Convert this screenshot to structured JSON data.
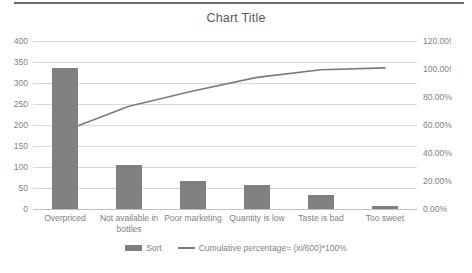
{
  "chart_data": {
    "type": "bar",
    "title": "Chart Title",
    "categories": [
      "Overpriced",
      "Not available in bottles",
      "Poor marketing",
      "Quantity is low",
      "Taste is bad",
      "Too sweet"
    ],
    "series": [
      {
        "name": "Sort",
        "type": "bar",
        "axis": "left",
        "values": [
          335,
          105,
          66,
          58,
          33,
          8
        ]
      },
      {
        "name": "Cumulative percentage= (xi/600)*100%",
        "type": "line",
        "axis": "right",
        "values": [
          55.83,
          73.33,
          84.33,
          94.0,
          99.5,
          100.83
        ]
      }
    ],
    "xlabel": "",
    "ylabel": "",
    "ylim": [
      0,
      400
    ],
    "y_ticks": [
      0,
      50,
      100,
      150,
      200,
      250,
      300,
      350,
      400
    ],
    "y2lim": [
      0,
      120
    ],
    "y2_ticks": [
      0,
      20,
      40,
      60,
      80,
      100,
      120
    ],
    "y2_tick_labels": [
      "0.00%",
      "20.00%",
      "40.00%",
      "60.00%",
      "80.00%",
      "100.00!",
      "120.00!"
    ],
    "grid": true,
    "legend_position": "bottom",
    "colors": {
      "bar": "#808080",
      "line": "#7b7b7b",
      "grid": "#d9d9d9",
      "text": "#7f7f7f",
      "title": "#595959"
    }
  },
  "legend": {
    "bar_label": "Sort",
    "line_label": "Cumulative percentage= (xi/600)*100%"
  }
}
